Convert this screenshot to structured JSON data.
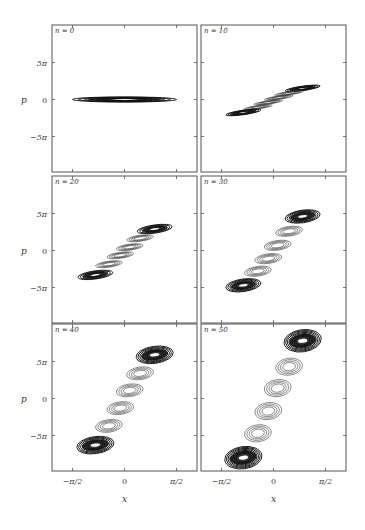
{
  "chart_data": {
    "type": "contour",
    "layout": "3 rows x 2 columns of phase-space panels",
    "xlabel": "x",
    "ylabel": "p",
    "xlim": [
      "-0.7π",
      "0.7π"
    ],
    "ylim": [
      "-10π",
      "10π"
    ],
    "x_ticks": [
      {
        "value_pi": -0.5,
        "label": "−π/2"
      },
      {
        "value_pi": 0,
        "label": "0"
      },
      {
        "value_pi": 0.5,
        "label": "π/2"
      }
    ],
    "y_ticks": [
      {
        "value_pi": 5,
        "label": "5π"
      },
      {
        "value_pi": 0,
        "label": "0"
      },
      {
        "value_pi": -5,
        "label": "−5π"
      }
    ],
    "x_units": "π",
    "y_units": "π",
    "panels": [
      {
        "title": "n = 0",
        "row": 0,
        "col": 0,
        "blobs": [
          {
            "x_pi": 0.0,
            "p_pi": 0.0,
            "half_width_pi": 0.5,
            "half_height_pi": 0.35,
            "rings": 6,
            "dark": true
          }
        ]
      },
      {
        "title": "n = 10",
        "row": 0,
        "col": 1,
        "blobs": [
          {
            "x_pi": 0.28,
            "p_pi": 1.5,
            "half_width_pi": 0.17,
            "half_height_pi": 0.3,
            "rings": 5,
            "dark": true
          },
          {
            "x_pi": 0.15,
            "p_pi": 0.85,
            "half_width_pi": 0.14,
            "half_height_pi": 0.22,
            "rings": 4,
            "dark": false
          },
          {
            "x_pi": 0.05,
            "p_pi": 0.25,
            "half_width_pi": 0.14,
            "half_height_pi": 0.22,
            "rings": 4,
            "dark": false
          },
          {
            "x_pi": -0.05,
            "p_pi": -0.4,
            "half_width_pi": 0.14,
            "half_height_pi": 0.22,
            "rings": 4,
            "dark": false
          },
          {
            "x_pi": -0.15,
            "p_pi": -1.05,
            "half_width_pi": 0.14,
            "half_height_pi": 0.22,
            "rings": 4,
            "dark": false
          },
          {
            "x_pi": -0.29,
            "p_pi": -1.75,
            "half_width_pi": 0.17,
            "half_height_pi": 0.3,
            "rings": 5,
            "dark": true
          }
        ]
      },
      {
        "title": "n = 20",
        "row": 1,
        "col": 0,
        "blobs": [
          {
            "x_pi": 0.29,
            "p_pi": 2.9,
            "half_width_pi": 0.17,
            "half_height_pi": 0.55,
            "rings": 5,
            "dark": true
          },
          {
            "x_pi": 0.15,
            "p_pi": 1.65,
            "half_width_pi": 0.13,
            "half_height_pi": 0.4,
            "rings": 4,
            "dark": false
          },
          {
            "x_pi": 0.05,
            "p_pi": 0.45,
            "half_width_pi": 0.13,
            "half_height_pi": 0.4,
            "rings": 4,
            "dark": false
          },
          {
            "x_pi": -0.04,
            "p_pi": -0.65,
            "half_width_pi": 0.13,
            "half_height_pi": 0.4,
            "rings": 4,
            "dark": false
          },
          {
            "x_pi": -0.15,
            "p_pi": -1.85,
            "half_width_pi": 0.13,
            "half_height_pi": 0.4,
            "rings": 4,
            "dark": false
          },
          {
            "x_pi": -0.28,
            "p_pi": -3.3,
            "half_width_pi": 0.17,
            "half_height_pi": 0.55,
            "rings": 5,
            "dark": true
          }
        ]
      },
      {
        "title": "n = 30",
        "row": 1,
        "col": 1,
        "blobs": [
          {
            "x_pi": 0.28,
            "p_pi": 4.6,
            "half_width_pi": 0.17,
            "half_height_pi": 0.85,
            "rings": 6,
            "dark": true
          },
          {
            "x_pi": 0.15,
            "p_pi": 2.6,
            "half_width_pi": 0.13,
            "half_height_pi": 0.65,
            "rings": 4,
            "dark": false
          },
          {
            "x_pi": 0.04,
            "p_pi": 0.7,
            "half_width_pi": 0.13,
            "half_height_pi": 0.65,
            "rings": 4,
            "dark": false
          },
          {
            "x_pi": -0.05,
            "p_pi": -1.1,
            "half_width_pi": 0.13,
            "half_height_pi": 0.65,
            "rings": 4,
            "dark": false
          },
          {
            "x_pi": -0.15,
            "p_pi": -2.8,
            "half_width_pi": 0.13,
            "half_height_pi": 0.65,
            "rings": 4,
            "dark": false
          },
          {
            "x_pi": -0.29,
            "p_pi": -4.7,
            "half_width_pi": 0.17,
            "half_height_pi": 0.85,
            "rings": 6,
            "dark": true
          }
        ]
      },
      {
        "title": "n = 40",
        "row": 2,
        "col": 0,
        "blobs": [
          {
            "x_pi": 0.29,
            "p_pi": 5.9,
            "half_width_pi": 0.18,
            "half_height_pi": 1.15,
            "rings": 7,
            "dark": true
          },
          {
            "x_pi": 0.15,
            "p_pi": 3.4,
            "half_width_pi": 0.13,
            "half_height_pi": 0.85,
            "rings": 4,
            "dark": false
          },
          {
            "x_pi": 0.05,
            "p_pi": 1.1,
            "half_width_pi": 0.13,
            "half_height_pi": 0.85,
            "rings": 4,
            "dark": false
          },
          {
            "x_pi": -0.04,
            "p_pi": -1.3,
            "half_width_pi": 0.13,
            "half_height_pi": 0.85,
            "rings": 4,
            "dark": false
          },
          {
            "x_pi": -0.15,
            "p_pi": -3.7,
            "half_width_pi": 0.13,
            "half_height_pi": 0.85,
            "rings": 4,
            "dark": false
          },
          {
            "x_pi": -0.28,
            "p_pi": -6.3,
            "half_width_pi": 0.18,
            "half_height_pi": 1.15,
            "rings": 7,
            "dark": true
          }
        ]
      },
      {
        "title": "n = 50",
        "row": 2,
        "col": 1,
        "blobs": [
          {
            "x_pi": 0.28,
            "p_pi": 7.8,
            "half_width_pi": 0.18,
            "half_height_pi": 1.5,
            "rings": 8,
            "dark": true
          },
          {
            "x_pi": 0.15,
            "p_pi": 4.3,
            "half_width_pi": 0.13,
            "half_height_pi": 1.15,
            "rings": 4,
            "dark": false
          },
          {
            "x_pi": 0.04,
            "p_pi": 1.4,
            "half_width_pi": 0.13,
            "half_height_pi": 1.15,
            "rings": 4,
            "dark": false
          },
          {
            "x_pi": -0.05,
            "p_pi": -1.7,
            "half_width_pi": 0.13,
            "half_height_pi": 1.15,
            "rings": 4,
            "dark": false
          },
          {
            "x_pi": -0.15,
            "p_pi": -4.7,
            "half_width_pi": 0.13,
            "half_height_pi": 1.15,
            "rings": 4,
            "dark": false
          },
          {
            "x_pi": -0.29,
            "p_pi": -8.0,
            "half_width_pi": 0.18,
            "half_height_pi": 1.5,
            "rings": 8,
            "dark": true
          }
        ]
      }
    ],
    "grid": false,
    "legend": "none"
  }
}
